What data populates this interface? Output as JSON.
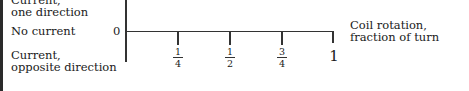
{
  "y_labels": {
    "top_line1": "Current,",
    "top_line2": "one direction",
    "middle": "No current",
    "bottom_line1": "Current,",
    "bottom_line2": "opposite direction"
  },
  "origin_label": "0",
  "x_axis_title": {
    "line1": "Coil rotation,",
    "line2": "fraction of turn"
  },
  "ticks": [
    {
      "num": "1",
      "den": "4"
    },
    {
      "num": "1",
      "den": "2"
    },
    {
      "num": "3",
      "den": "4"
    }
  ],
  "end_tick_label": "1",
  "colors": {
    "axis": "#333333",
    "text": "#1a1a1a",
    "background": "#ffffff"
  }
}
